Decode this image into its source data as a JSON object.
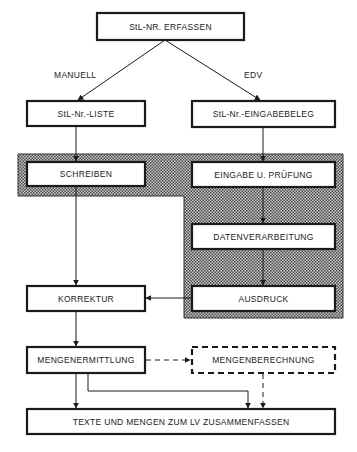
{
  "nodes": {
    "erfassen": "StL-NR. ERFASSEN",
    "liste": "StL-Nr.-LISTE",
    "eingabebeleg": "StL-Nr.-EINGABEBELEG",
    "schreiben": "SCHREIBEN",
    "eingabe_pruefung": "EINGABE U. PRÜFUNG",
    "datenverarbeitung": "DATENVERARBEITUNG",
    "korrektur": "KORREKTUR",
    "ausdruck": "AUSDRUCK",
    "mengenermittlung": "MENGENERMITTLUNG",
    "mengenberechnung": "MENGENBERECHNUNG",
    "zusammenfassen": "TEXTE UND MENGEN ZUM LV ZUSAMMENFASSEN"
  },
  "edge_labels": {
    "manuell": "MANUELL",
    "edv": "EDV"
  },
  "colors": {
    "stroke": "#1a1a1a",
    "shade": "#9a9a9a"
  }
}
